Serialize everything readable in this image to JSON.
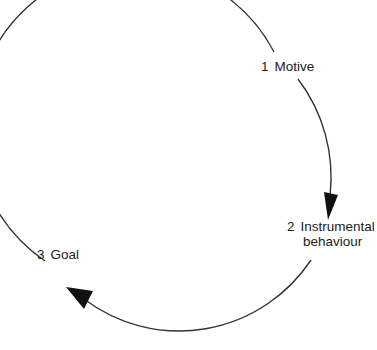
{
  "diagram": {
    "type": "cycle",
    "stroke_color": "#333333",
    "arrow_color": "#111111",
    "nodes": [
      {
        "id": 1,
        "number": "1",
        "label": "Motive"
      },
      {
        "id": 2,
        "number": "2",
        "label_line1": "Instrumental",
        "label_line2": "behaviour"
      },
      {
        "id": 3,
        "number": "3",
        "label": "Goal"
      }
    ],
    "edges": [
      {
        "from": 3,
        "to": 1,
        "arrowhead": false
      },
      {
        "from": 1,
        "to": 2,
        "arrowhead": true
      },
      {
        "from": 2,
        "to": 3,
        "arrowhead": true
      }
    ]
  }
}
